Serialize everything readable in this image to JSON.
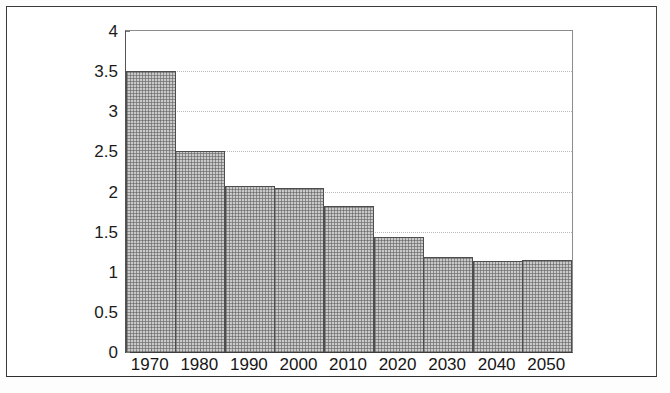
{
  "figure": {
    "caption_partial": ""
  },
  "chart_data": {
    "type": "bar",
    "title": "",
    "subtitle": "",
    "xlabel": "",
    "ylabel": "",
    "categories": [
      "1970",
      "1980",
      "1990",
      "2000",
      "2010",
      "2020",
      "2030",
      "2040",
      "2050"
    ],
    "values": [
      3.5,
      2.5,
      2.07,
      2.04,
      1.82,
      1.43,
      1.18,
      1.14,
      1.15
    ],
    "series": [
      {
        "name": "",
        "values": [
          3.5,
          2.5,
          2.07,
          2.04,
          1.82,
          1.43,
          1.18,
          1.14,
          1.15
        ]
      }
    ],
    "ylim": [
      0,
      4
    ],
    "ytick_values": [
      0,
      0.5,
      1,
      1.5,
      2,
      2.5,
      3,
      3.5,
      4
    ],
    "ytick_labels": [
      "0",
      "0.5",
      "1",
      "1.5",
      "2",
      "2.5",
      "3",
      "3.5",
      "4"
    ],
    "xtick_labels": [
      "1970",
      "1980",
      "1990",
      "2000",
      "2010",
      "2020",
      "2030",
      "2040",
      "2050"
    ],
    "grid": true,
    "grid_axis": "y",
    "grid_style": "dotted",
    "legend": false,
    "legend_position": "none",
    "bar_fill_color": "#c9c9c9",
    "bar_edge_color": "#4d4d4d",
    "axis_color": "#3d3d3d",
    "background_color": "#ffffff"
  }
}
